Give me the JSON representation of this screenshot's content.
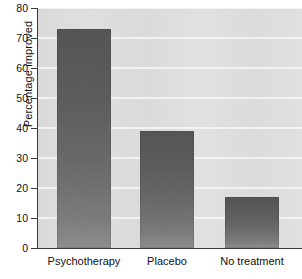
{
  "chart_data": {
    "type": "bar",
    "title": "",
    "xlabel": "",
    "ylabel": "Percentage improved",
    "categories": [
      "Psychotherapy",
      "Placebo",
      "No treatment"
    ],
    "values": [
      73,
      39,
      17
    ],
    "ylim": [
      0,
      80
    ],
    "yticks": [
      0,
      10,
      20,
      30,
      40,
      50,
      60,
      70,
      80
    ],
    "ytick_labels": [
      "0",
      "10",
      "20",
      "30",
      "40",
      "50",
      "60",
      "70",
      "80"
    ],
    "grid": "horizontal",
    "legend": "none",
    "bar_color": "#5c5c5c",
    "plot_background": "#dedede",
    "gridline_color": "#f7f7f7",
    "axis_color": "#3c3c3c"
  }
}
